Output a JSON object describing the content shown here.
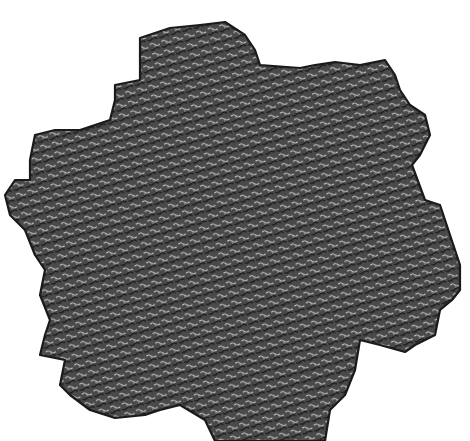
{
  "figure": {
    "background_color": "#ffffff",
    "fill_color": "#4a4a4a",
    "tile_stroke_color": "#111111",
    "tile_gap_color": "#d8d8d8",
    "outline": [
      [
        140,
        38
      ],
      [
        170,
        28
      ],
      [
        200,
        25
      ],
      [
        225,
        22
      ],
      [
        245,
        35
      ],
      [
        255,
        50
      ],
      [
        260,
        65
      ],
      [
        300,
        68
      ],
      [
        315,
        65
      ],
      [
        335,
        62
      ],
      [
        360,
        65
      ],
      [
        385,
        60
      ],
      [
        395,
        75
      ],
      [
        400,
        90
      ],
      [
        410,
        105
      ],
      [
        425,
        115
      ],
      [
        430,
        135
      ],
      [
        420,
        155
      ],
      [
        412,
        165
      ],
      [
        425,
        200
      ],
      [
        440,
        205
      ],
      [
        445,
        220
      ],
      [
        455,
        250
      ],
      [
        460,
        265
      ],
      [
        460,
        290
      ],
      [
        452,
        300
      ],
      [
        440,
        310
      ],
      [
        435,
        335
      ],
      [
        415,
        345
      ],
      [
        405,
        352
      ],
      [
        380,
        345
      ],
      [
        360,
        340
      ],
      [
        355,
        370
      ],
      [
        345,
        395
      ],
      [
        330,
        410
      ],
      [
        325,
        441
      ],
      [
        215,
        441
      ],
      [
        205,
        420
      ],
      [
        180,
        405
      ],
      [
        160,
        410
      ],
      [
        145,
        415
      ],
      [
        115,
        418
      ],
      [
        90,
        410
      ],
      [
        70,
        395
      ],
      [
        60,
        385
      ],
      [
        65,
        360
      ],
      [
        40,
        355
      ],
      [
        45,
        335
      ],
      [
        50,
        320
      ],
      [
        40,
        295
      ],
      [
        45,
        270
      ],
      [
        35,
        255
      ],
      [
        25,
        230
      ],
      [
        10,
        215
      ],
      [
        5,
        195
      ],
      [
        15,
        180
      ],
      [
        30,
        180
      ],
      [
        30,
        160
      ],
      [
        35,
        135
      ],
      [
        55,
        130
      ],
      [
        80,
        130
      ],
      [
        110,
        120
      ],
      [
        115,
        100
      ],
      [
        115,
        85
      ],
      [
        140,
        80
      ]
    ]
  }
}
